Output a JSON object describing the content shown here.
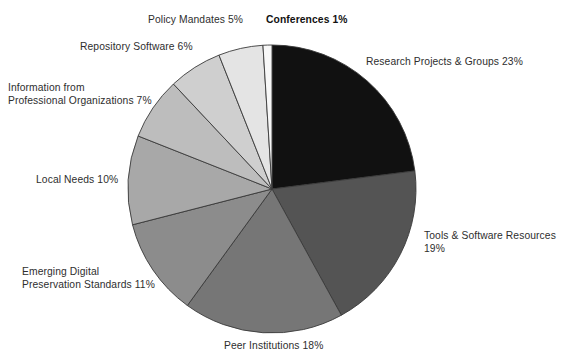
{
  "chart_data": {
    "type": "pie",
    "title": "",
    "subtitle": "",
    "xlabel": "",
    "ylabel": "",
    "legend_position": "outside-labels",
    "grid": false,
    "total_percent": 100,
    "start_angle_deg": 0,
    "direction": "clockwise",
    "categories": [
      "Research Projects & Groups",
      "Tools & Software Resources",
      "Peer Institutions",
      "Emerging Digital Preservation Standards",
      "Local Needs",
      "Information from Professional Organizations",
      "Repository Software",
      "Policy Mandates",
      "Conferences"
    ],
    "values": [
      23,
      19,
      18,
      11,
      10,
      7,
      6,
      5,
      1
    ],
    "colors": [
      "#111111",
      "#545454",
      "#767676",
      "#8c8c8c",
      "#a8a8a8",
      "#bdbdbd",
      "#cfcfcf",
      "#e4e4e4",
      "#f7f7f7"
    ],
    "slices": [
      {
        "label": "Research Projects & Groups",
        "value": 23,
        "color": "#111111"
      },
      {
        "label": "Tools & Software Resources",
        "value": 19,
        "color": "#545454"
      },
      {
        "label": "Peer Institutions",
        "value": 18,
        "color": "#767676"
      },
      {
        "label": "Emerging Digital Preservation Standards",
        "value": 11,
        "color": "#8c8c8c"
      },
      {
        "label": "Local Needs",
        "value": 10,
        "color": "#a8a8a8"
      },
      {
        "label": "Information from Professional Organizations",
        "value": 7,
        "color": "#bdbdbd"
      },
      {
        "label": "Repository Software",
        "value": 6,
        "color": "#cfcfcf"
      },
      {
        "label": "Policy Mandates",
        "value": 5,
        "color": "#e4e4e4"
      },
      {
        "label": "Conferences",
        "value": 1,
        "color": "#f7f7f7"
      }
    ]
  },
  "labels": {
    "research": "Research Projects & Groups 23%",
    "tools": "Tools & Software Resources 19%",
    "peer": "Peer Institutions 18%",
    "emerging": "Emerging Digital\nPreservation Standards 11%",
    "local": "Local Needs 10%",
    "info": "Information from\nProfessional Organizations 7%",
    "repository": "Repository Software 6%",
    "policy": "Policy Mandates 5%",
    "conferences": "Conferences 1%"
  },
  "style": {
    "background": "#ffffff",
    "slice_outline": "#3a3a3a",
    "text_color": "#2e2e2e"
  }
}
